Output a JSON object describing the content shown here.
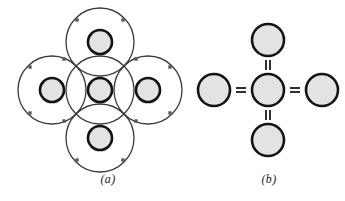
{
  "figure": {
    "domain": "chemistry-bonding-diagram",
    "background_color": "#ffffff",
    "width": 345,
    "height": 201,
    "captions": [
      {
        "key": "a",
        "label": "(a)"
      },
      {
        "key": "b",
        "label": "(b)"
      }
    ]
  },
  "colors": {
    "nucleus_fill": "#e3e3e3",
    "nucleus_stroke": "#141414",
    "shell_stroke": "#3b3b3b",
    "electron_dot": "#5a5a5a",
    "bond_stroke": "#1a1a1a",
    "caption_text": "#1a1a1a",
    "background": "#ffffff"
  },
  "panel_a": {
    "label": "(a)",
    "description": "Electron shell representation of a central atom covalently bonded to four neighbouring atoms",
    "nucleus_radius": 12,
    "nucleus_stroke_width": 2.6,
    "shell_radius": 34,
    "shell_stroke_width": 1.3,
    "electron_dot_size": 3.4,
    "atoms": [
      {
        "name": "center-atom",
        "cx": 100,
        "cy": 90
      },
      {
        "name": "top-atom",
        "cx": 100,
        "cy": 42
      },
      {
        "name": "bottom-atom",
        "cx": 100,
        "cy": 138
      },
      {
        "name": "left-atom",
        "cx": 52,
        "cy": 90
      },
      {
        "name": "right-atom",
        "cx": 148,
        "cy": 90
      }
    ],
    "shared_electron_pairs": [
      {
        "name": "electron-pair-upper-left",
        "x": 64,
        "y": 59
      },
      {
        "name": "electron-pair-upper-right",
        "x": 136,
        "y": 59
      },
      {
        "name": "electron-pair-lower-left",
        "x": 64,
        "y": 121
      },
      {
        "name": "electron-pair-lower-right",
        "x": 136,
        "y": 121
      }
    ],
    "outer_electrons": [
      {
        "name": "electron-top-atom-nw",
        "x": 77,
        "y": 20
      },
      {
        "name": "electron-top-atom-ne",
        "x": 123,
        "y": 20
      },
      {
        "name": "electron-bottom-atom-sw",
        "x": 77,
        "y": 160
      },
      {
        "name": "electron-bottom-atom-se",
        "x": 123,
        "y": 160
      },
      {
        "name": "electron-left-atom-nw",
        "x": 30,
        "y": 67
      },
      {
        "name": "electron-left-atom-sw",
        "x": 30,
        "y": 113
      },
      {
        "name": "electron-right-atom-ne",
        "x": 170,
        "y": 67
      },
      {
        "name": "electron-right-atom-se",
        "x": 170,
        "y": 113
      }
    ]
  },
  "panel_b": {
    "label": "(b)",
    "description": "Simplified schematic of the same unit showing four double bonds",
    "atom_radius": 16,
    "atom_stroke_width": 2.6,
    "atoms": [
      {
        "name": "center-atom",
        "cx": 268,
        "cy": 90
      },
      {
        "name": "top-atom",
        "cx": 268,
        "cy": 40
      },
      {
        "name": "bottom-atom",
        "cx": 268,
        "cy": 140
      },
      {
        "name": "left-atom",
        "cx": 214,
        "cy": 90
      },
      {
        "name": "right-atom",
        "cx": 322,
        "cy": 90
      }
    ],
    "bonds": [
      {
        "name": "bond-top",
        "symbol": "=",
        "orientation": "vertical",
        "x": 268,
        "y": 65
      },
      {
        "name": "bond-bottom",
        "symbol": "=",
        "orientation": "vertical",
        "x": 268,
        "y": 115
      },
      {
        "name": "bond-left",
        "symbol": "=",
        "orientation": "horizontal",
        "x": 241,
        "y": 90
      },
      {
        "name": "bond-right",
        "symbol": "=",
        "orientation": "horizontal",
        "x": 295,
        "y": 90
      }
    ],
    "bond_bar": {
      "length": 11,
      "gap": 4,
      "width": 1.8
    }
  }
}
